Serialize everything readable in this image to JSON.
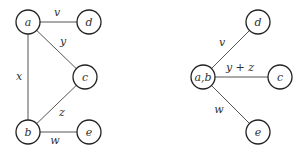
{
  "graphs": [
    {
      "name": "original-graph",
      "nodes": [
        {
          "id": "a",
          "label": "a",
          "x": 28,
          "y": 22
        },
        {
          "id": "d",
          "label": "d",
          "x": 89,
          "y": 22
        },
        {
          "id": "c",
          "label": "c",
          "x": 85,
          "y": 77
        },
        {
          "id": "b",
          "label": "b",
          "x": 28,
          "y": 132
        },
        {
          "id": "e",
          "label": "e",
          "x": 89,
          "y": 132
        }
      ],
      "edges": [
        {
          "from": "a",
          "to": "d",
          "label": "v",
          "lx": 57,
          "ly": 16
        },
        {
          "from": "a",
          "to": "c",
          "label": "y",
          "lx": 63,
          "ly": 45
        },
        {
          "from": "a",
          "to": "b",
          "label": "x",
          "lx": 19,
          "ly": 80
        },
        {
          "from": "b",
          "to": "c",
          "label": "z",
          "lx": 62,
          "ly": 116
        },
        {
          "from": "b",
          "to": "e",
          "label": "w",
          "lx": 55,
          "ly": 144
        }
      ]
    },
    {
      "name": "contracted-graph",
      "nodes": [
        {
          "id": "ab",
          "label": "a,b",
          "x": 203,
          "y": 77
        },
        {
          "id": "d",
          "label": "d",
          "x": 258,
          "y": 22
        },
        {
          "id": "c",
          "label": "c",
          "x": 280,
          "y": 77
        },
        {
          "id": "e",
          "label": "e",
          "x": 258,
          "y": 132
        }
      ],
      "edges": [
        {
          "from": "ab",
          "to": "d",
          "label": "v",
          "lx": 222,
          "ly": 46
        },
        {
          "from": "ab",
          "to": "c",
          "label": "y + z",
          "lx": 240,
          "ly": 71
        },
        {
          "from": "ab",
          "to": "e",
          "label": "w",
          "lx": 219,
          "ly": 113
        }
      ]
    }
  ]
}
